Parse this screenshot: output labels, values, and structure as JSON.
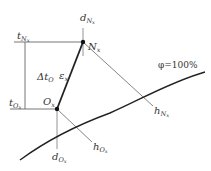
{
  "diagram": {
    "type": "psychrometric-state-diagram",
    "points": {
      "N": {
        "label": "N",
        "sub": "x",
        "x": 83,
        "y": 42
      },
      "O": {
        "label": "O",
        "sub": "x",
        "x": 57,
        "y": 109
      }
    },
    "labels": {
      "t_N": {
        "main": "t",
        "sub": "N",
        "subsub": "x"
      },
      "t_O": {
        "main": "t",
        "sub": "O",
        "subsub": "x"
      },
      "d_N": {
        "main": "d",
        "sub": "N",
        "subsub": "x"
      },
      "d_O": {
        "main": "d",
        "sub": "O",
        "subsub": "x"
      },
      "h_N": {
        "main": "h",
        "sub": "N",
        "subsub": "x"
      },
      "h_O": {
        "main": "h",
        "sub": "O",
        "subsub": "x"
      },
      "delta_t": {
        "main": "Δt",
        "sub": "O"
      },
      "epsilon": {
        "main": "ε",
        "sub": "x"
      },
      "saturation": "φ=100%"
    },
    "colors": {
      "line": "#555555",
      "thick": "#222222",
      "text": "#333333"
    }
  }
}
